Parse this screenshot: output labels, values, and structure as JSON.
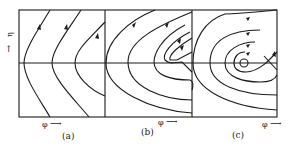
{
  "figure": {
    "y_axis_label": "η",
    "panels": [
      {
        "id": "a",
        "caption": "(a)",
        "x_axis_label": "φ"
      },
      {
        "id": "b",
        "caption": "(b)",
        "x_axis_label": "φ"
      },
      {
        "id": "c",
        "caption": "(c)",
        "x_axis_label": "φ"
      }
    ],
    "line_color": "#1a1a1a"
  }
}
